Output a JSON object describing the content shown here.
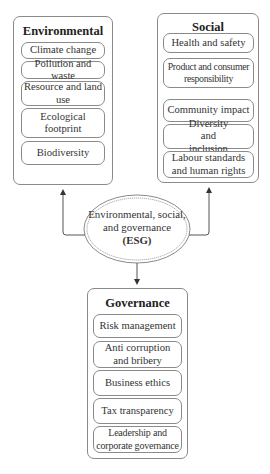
{
  "center": {
    "line1": "Environmental, social,",
    "line2": "and governance",
    "line3": "(ESG)"
  },
  "groups": {
    "environmental": {
      "title": "Environmental",
      "items": [
        "Climate change",
        "Pollution and waste",
        "Resource and land use",
        "Ecological footprint",
        "Biodiversity"
      ]
    },
    "social": {
      "title": "Social",
      "items": [
        "Health and safety",
        "Product and consumer responsibility",
        "Community impact",
        "Diversity and inclusion",
        "Labour standards and human rights"
      ]
    },
    "governance": {
      "title": "Governance",
      "items": [
        "Risk management",
        "Anti corruption and bribery",
        "Business ethics",
        "Tax transparency",
        "Leadership and corporate governance"
      ]
    }
  },
  "colors": {
    "line": "#8a8a8a",
    "text": "#333333",
    "background": "#ffffff"
  }
}
